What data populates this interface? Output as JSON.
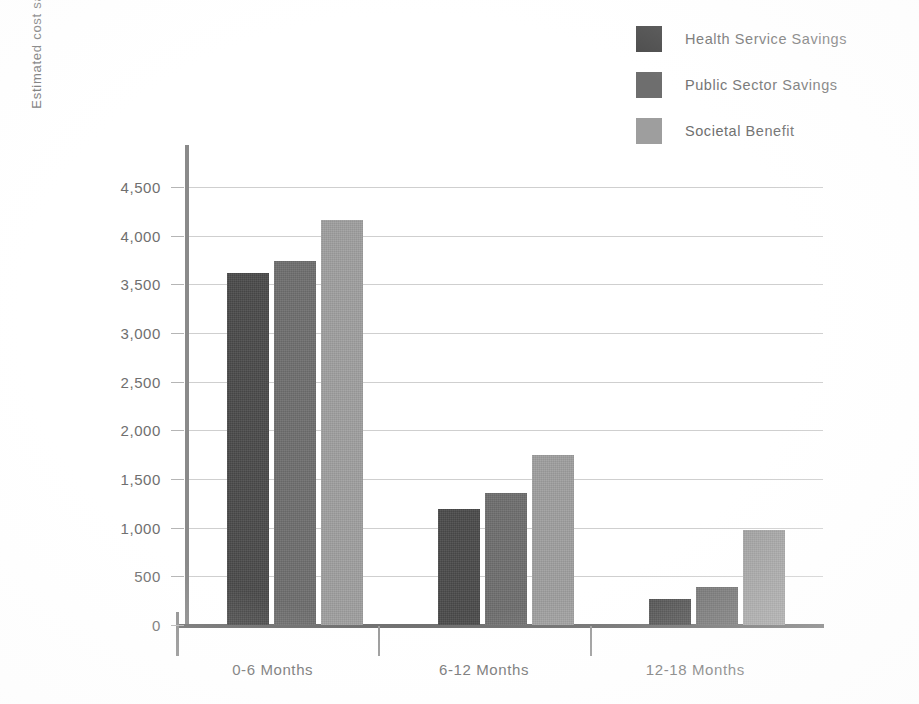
{
  "chart_data": {
    "type": "bar",
    "title": "",
    "xlabel": "",
    "ylabel": "Estimated cost saving per service user (£)",
    "categories": [
      "0-6 Months",
      "6-12 Months",
      "12-18 Months"
    ],
    "series": [
      {
        "name": "Health Service Savings",
        "color": "#4a4a4a",
        "values": [
          3620,
          1190,
          270
        ]
      },
      {
        "name": "Public Sector Savings",
        "color": "#6e6e6e",
        "values": [
          3735,
          1355,
          390
        ]
      },
      {
        "name": "Societal Benefit",
        "color": "#9e9e9e",
        "values": [
          4160,
          1750,
          975
        ]
      }
    ],
    "ylim": [
      0,
      4500
    ],
    "ytick_step": 500,
    "ytick_labels": [
      "0",
      "500",
      "1,000",
      "1,500",
      "2,000",
      "2,500",
      "3,000",
      "3,500",
      "4,000",
      "4,500"
    ],
    "ytick_values": [
      0,
      500,
      1000,
      1500,
      2000,
      2500,
      3000,
      3500,
      4000,
      4500
    ],
    "grid": true,
    "legend_position": "top-right"
  },
  "legend": {
    "items": [
      {
        "label": "Health Service Savings",
        "color": "#4a4a4a"
      },
      {
        "label": "Public Sector Savings",
        "color": "#6e6e6e"
      },
      {
        "label": "Societal Benefit",
        "color": "#9e9e9e"
      }
    ]
  },
  "axes": {
    "y_title": "Estimated cost saving per service user (£)"
  }
}
